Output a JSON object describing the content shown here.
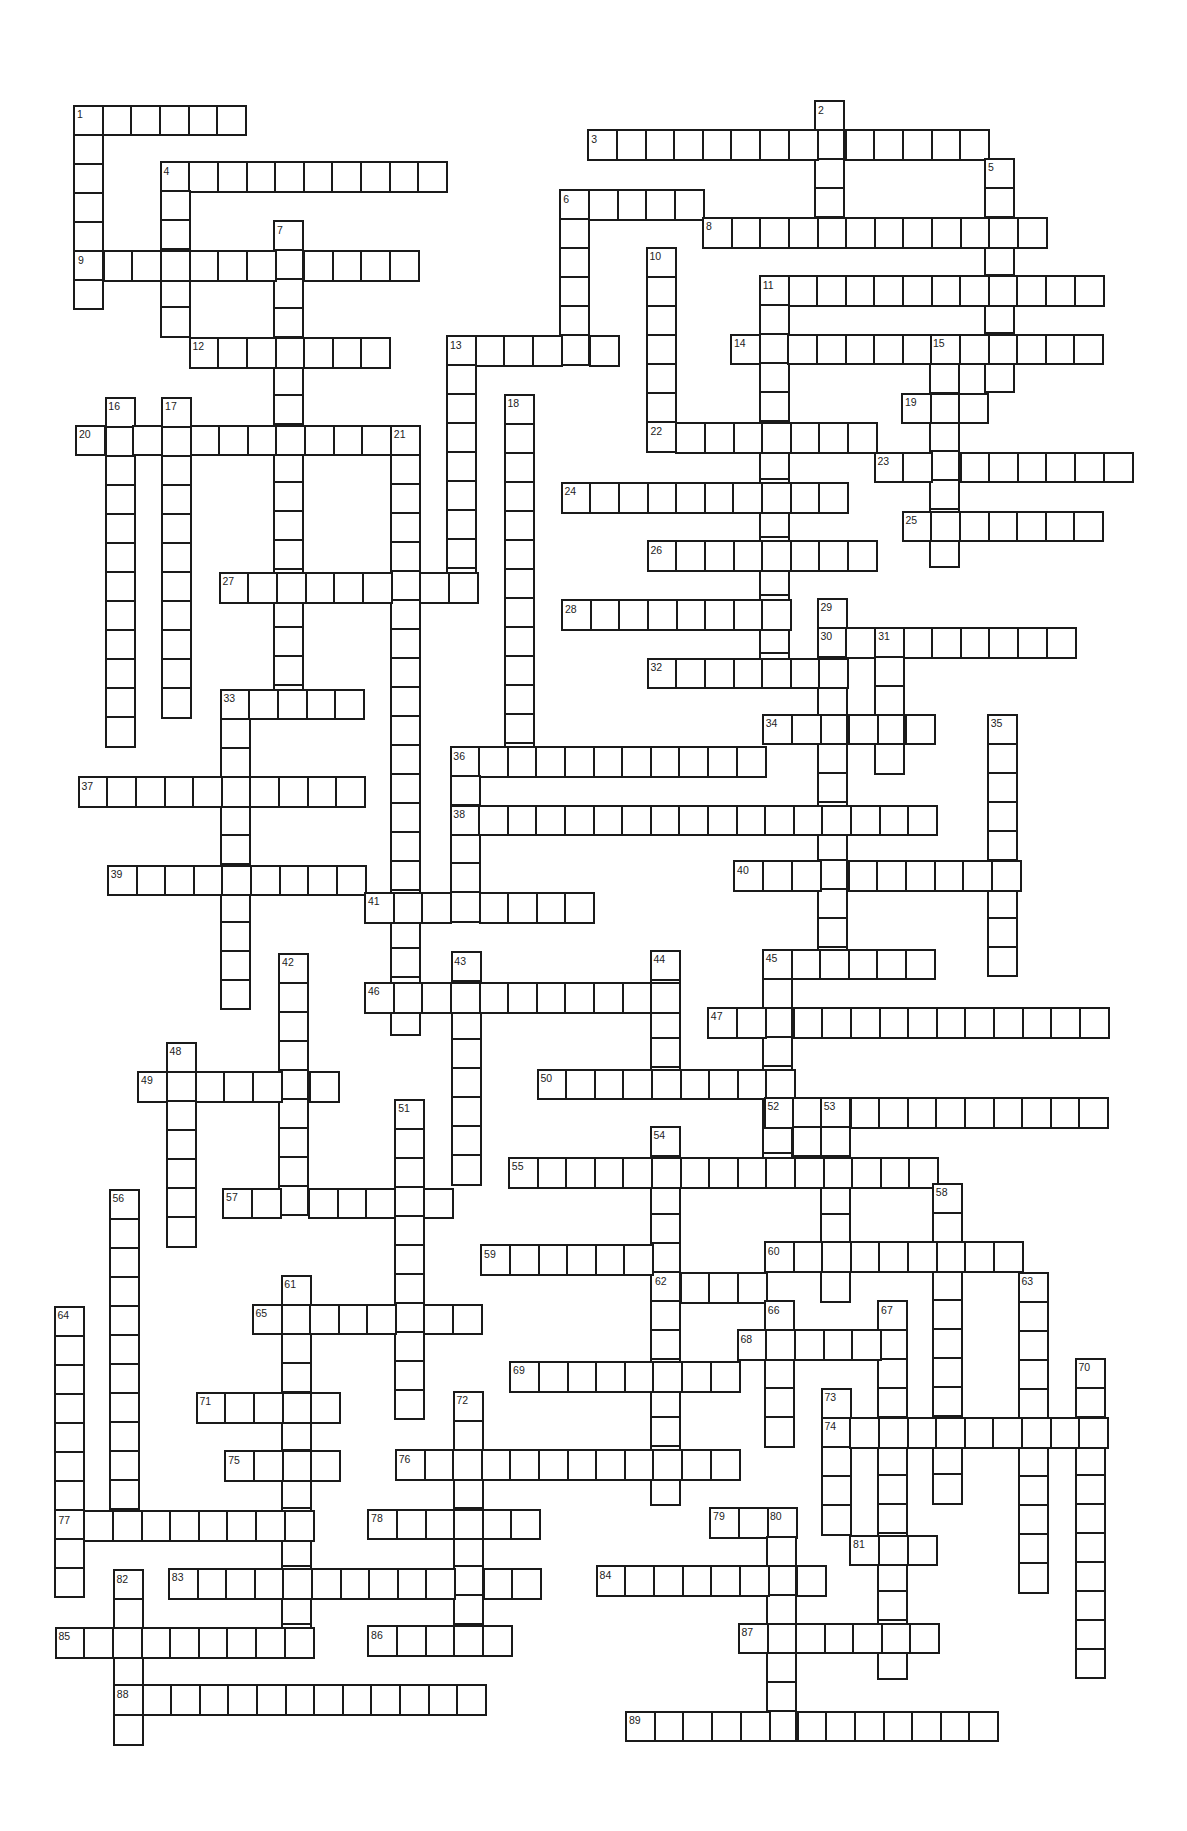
{
  "puzzle": {
    "type": "crossword",
    "cell_size_px": {
      "w": 28.6,
      "h": 29
    },
    "words": [
      {
        "n": 1,
        "dir": "across",
        "x": 74.5,
        "y": 106,
        "len": 6
      },
      {
        "n": 1,
        "dir": "down",
        "x": 74.5,
        "y": 106,
        "len": 7
      },
      {
        "n": 2,
        "dir": "down",
        "x": 815.6,
        "y": 101.7,
        "len": 5
      },
      {
        "n": 3,
        "dir": "across",
        "x": 588.7,
        "y": 130.7,
        "len": 14
      },
      {
        "n": 4,
        "dir": "across",
        "x": 161,
        "y": 162.7,
        "len": 10
      },
      {
        "n": 4,
        "dir": "down",
        "x": 161,
        "y": 162.7,
        "len": 6
      },
      {
        "n": 5,
        "dir": "down",
        "x": 985.6,
        "y": 159.3,
        "len": 8
      },
      {
        "n": 6,
        "dir": "across",
        "x": 560.7,
        "y": 190.7,
        "len": 5
      },
      {
        "n": 6,
        "dir": "down",
        "x": 560.7,
        "y": 190.7,
        "len": 6
      },
      {
        "n": 7,
        "dir": "down",
        "x": 274.5,
        "y": 221.7,
        "len": 17
      },
      {
        "n": 8,
        "dir": "across",
        "x": 703.5,
        "y": 218.3,
        "len": 12
      },
      {
        "n": 9,
        "dir": "across",
        "x": 75.5,
        "y": 251.7,
        "len": 12
      },
      {
        "n": 10,
        "dir": "down",
        "x": 647,
        "y": 248.3,
        "len": 7
      },
      {
        "n": 11,
        "dir": "across",
        "x": 760.2,
        "y": 276.7,
        "len": 12
      },
      {
        "n": 11,
        "dir": "down",
        "x": 760.2,
        "y": 276.7,
        "len": 14
      },
      {
        "n": 12,
        "dir": "across",
        "x": 190,
        "y": 338.3,
        "len": 7
      },
      {
        "n": 13,
        "dir": "across",
        "x": 447.4,
        "y": 336.7,
        "len": 6
      },
      {
        "n": 13,
        "dir": "down",
        "x": 447.4,
        "y": 336.7,
        "len": 9
      },
      {
        "n": 14,
        "dir": "across",
        "x": 731.5,
        "y": 335,
        "len": 13
      },
      {
        "n": 15,
        "dir": "down",
        "x": 930.5,
        "y": 335,
        "len": 8
      },
      {
        "n": 16,
        "dir": "down",
        "x": 105.8,
        "y": 398.3,
        "len": 12
      },
      {
        "n": 17,
        "dir": "down",
        "x": 162.6,
        "y": 398.3,
        "len": 11
      },
      {
        "n": 18,
        "dir": "down",
        "x": 505,
        "y": 395,
        "len": 13
      },
      {
        "n": 19,
        "dir": "across",
        "x": 902.5,
        "y": 394,
        "len": 3
      },
      {
        "n": 20,
        "dir": "across",
        "x": 76.5,
        "y": 426,
        "len": 12
      },
      {
        "n": 21,
        "dir": "down",
        "x": 391.3,
        "y": 426,
        "len": 21
      },
      {
        "n": 22,
        "dir": "across",
        "x": 648,
        "y": 423.3,
        "len": 8
      },
      {
        "n": 23,
        "dir": "across",
        "x": 875,
        "y": 453,
        "len": 9
      },
      {
        "n": 24,
        "dir": "across",
        "x": 562,
        "y": 483.3,
        "len": 10
      },
      {
        "n": 25,
        "dir": "across",
        "x": 903,
        "y": 512,
        "len": 7
      },
      {
        "n": 26,
        "dir": "across",
        "x": 648,
        "y": 541.7,
        "len": 8
      },
      {
        "n": 27,
        "dir": "across",
        "x": 220,
        "y": 573.3,
        "len": 9
      },
      {
        "n": 28,
        "dir": "across",
        "x": 562.5,
        "y": 600.7,
        "len": 8
      },
      {
        "n": 29,
        "dir": "down",
        "x": 818,
        "y": 599,
        "len": 13
      },
      {
        "n": 30,
        "dir": "across",
        "x": 818,
        "y": 628.3,
        "len": 9
      },
      {
        "n": 31,
        "dir": "down",
        "x": 875.7,
        "y": 628.3,
        "len": 5
      },
      {
        "n": 32,
        "dir": "across",
        "x": 648,
        "y": 659,
        "len": 7
      },
      {
        "n": 33,
        "dir": "across",
        "x": 221,
        "y": 690,
        "len": 5
      },
      {
        "n": 33,
        "dir": "down",
        "x": 221,
        "y": 690,
        "len": 11
      },
      {
        "n": 34,
        "dir": "across",
        "x": 763.2,
        "y": 715,
        "len": 6
      },
      {
        "n": 35,
        "dir": "down",
        "x": 988.2,
        "y": 715,
        "len": 9
      },
      {
        "n": 36,
        "dir": "across",
        "x": 450.8,
        "y": 747.7,
        "len": 11
      },
      {
        "n": 36,
        "dir": "down",
        "x": 450.8,
        "y": 747.7,
        "len": 6
      },
      {
        "n": 37,
        "dir": "across",
        "x": 79,
        "y": 777.7,
        "len": 10
      },
      {
        "n": 38,
        "dir": "across",
        "x": 450.8,
        "y": 806,
        "len": 17
      },
      {
        "n": 39,
        "dir": "across",
        "x": 108.2,
        "y": 866,
        "len": 9
      },
      {
        "n": 40,
        "dir": "across",
        "x": 734.6,
        "y": 861.7,
        "len": 10
      },
      {
        "n": 41,
        "dir": "across",
        "x": 365.4,
        "y": 893.3,
        "len": 8
      },
      {
        "n": 42,
        "dir": "down",
        "x": 279.6,
        "y": 954,
        "len": 9
      },
      {
        "n": 43,
        "dir": "down",
        "x": 451.8,
        "y": 952.7,
        "len": 8
      },
      {
        "n": 44,
        "dir": "down",
        "x": 651,
        "y": 951,
        "len": 5
      },
      {
        "n": 45,
        "dir": "across",
        "x": 763.2,
        "y": 950,
        "len": 6
      },
      {
        "n": 45,
        "dir": "down",
        "x": 763.2,
        "y": 950,
        "len": 8
      },
      {
        "n": 46,
        "dir": "across",
        "x": 365.4,
        "y": 983.3,
        "len": 11
      },
      {
        "n": 47,
        "dir": "across",
        "x": 708.3,
        "y": 1008.3,
        "len": 14
      },
      {
        "n": 48,
        "dir": "down",
        "x": 167.1,
        "y": 1043.3,
        "len": 7
      },
      {
        "n": 49,
        "dir": "across",
        "x": 138.6,
        "y": 1072.3,
        "len": 7
      },
      {
        "n": 50,
        "dir": "across",
        "x": 537.9,
        "y": 1070,
        "len": 9
      },
      {
        "n": 51,
        "dir": "down",
        "x": 395.7,
        "y": 1100,
        "len": 11
      },
      {
        "n": 52,
        "dir": "across",
        "x": 765,
        "y": 1098.3,
        "len": 12
      },
      {
        "n": null,
        "dir": "down",
        "x": 793,
        "y": 1098.3,
        "len": 3
      },
      {
        "n": 53,
        "dir": "down",
        "x": 821.2,
        "y": 1098.3,
        "len": 7
      },
      {
        "n": 54,
        "dir": "down",
        "x": 651,
        "y": 1127.3,
        "len": 13
      },
      {
        "n": 55,
        "dir": "across",
        "x": 509.3,
        "y": 1158.3,
        "len": 15
      },
      {
        "n": 56,
        "dir": "down",
        "x": 110,
        "y": 1190,
        "len": 12
      },
      {
        "n": 57,
        "dir": "across",
        "x": 223.6,
        "y": 1189,
        "len": 8
      },
      {
        "n": 58,
        "dir": "down",
        "x": 933.3,
        "y": 1184.3,
        "len": 11
      },
      {
        "n": 59,
        "dir": "across",
        "x": 481.6,
        "y": 1245.7,
        "len": 7
      },
      {
        "n": 60,
        "dir": "across",
        "x": 765.3,
        "y": 1242.7,
        "len": 9
      },
      {
        "n": 61,
        "dir": "down",
        "x": 281.8,
        "y": 1276,
        "len": 13
      },
      {
        "n": 62,
        "dir": "across",
        "x": 652.4,
        "y": 1273.3,
        "len": 4
      },
      {
        "n": 63,
        "dir": "down",
        "x": 1019,
        "y": 1273.3,
        "len": 11
      },
      {
        "n": 64,
        "dir": "down",
        "x": 55,
        "y": 1307,
        "len": 10
      },
      {
        "n": 65,
        "dir": "across",
        "x": 253,
        "y": 1305,
        "len": 8
      },
      {
        "n": 66,
        "dir": "down",
        "x": 765.3,
        "y": 1301.7,
        "len": 5
      },
      {
        "n": 67,
        "dir": "down",
        "x": 878.6,
        "y": 1301.5,
        "len": 13
      },
      {
        "n": 68,
        "dir": "across",
        "x": 738,
        "y": 1330.7,
        "len": 6
      },
      {
        "n": 69,
        "dir": "across",
        "x": 510.6,
        "y": 1362.3,
        "len": 8
      },
      {
        "n": 70,
        "dir": "down",
        "x": 1076,
        "y": 1359,
        "len": 11
      },
      {
        "n": 71,
        "dir": "across",
        "x": 197,
        "y": 1393.3,
        "len": 5
      },
      {
        "n": 72,
        "dir": "down",
        "x": 454,
        "y": 1392.3,
        "len": 9
      },
      {
        "n": 73,
        "dir": "down",
        "x": 822,
        "y": 1389.3,
        "len": 5
      },
      {
        "n": 74,
        "dir": "across",
        "x": 822,
        "y": 1418.3,
        "len": 10
      },
      {
        "n": 75,
        "dir": "across",
        "x": 225.7,
        "y": 1451.7,
        "len": 4
      },
      {
        "n": 76,
        "dir": "across",
        "x": 396.2,
        "y": 1450.7,
        "len": 12
      },
      {
        "n": 77,
        "dir": "across",
        "x": 56,
        "y": 1511.7,
        "len": 9
      },
      {
        "n": 78,
        "dir": "across",
        "x": 368.6,
        "y": 1510,
        "len": 6
      },
      {
        "n": 79,
        "dir": "across",
        "x": 710.6,
        "y": 1508.3,
        "len": 3
      },
      {
        "n": 80,
        "dir": "down",
        "x": 767.4,
        "y": 1508.3,
        "len": 8
      },
      {
        "n": 81,
        "dir": "across",
        "x": 850.6,
        "y": 1536,
        "len": 3
      },
      {
        "n": 82,
        "dir": "down",
        "x": 114,
        "y": 1570.7,
        "len": 6
      },
      {
        "n": 83,
        "dir": "across",
        "x": 169.3,
        "y": 1569.3,
        "len": 13
      },
      {
        "n": 84,
        "dir": "across",
        "x": 597.1,
        "y": 1566.7,
        "len": 8
      },
      {
        "n": 85,
        "dir": "across",
        "x": 56,
        "y": 1628.3,
        "len": 9
      },
      {
        "n": 86,
        "dir": "across",
        "x": 368.6,
        "y": 1626.7,
        "len": 5
      },
      {
        "n": 87,
        "dir": "across",
        "x": 739,
        "y": 1624,
        "len": 7
      },
      {
        "n": 88,
        "dir": "across",
        "x": 114.3,
        "y": 1685.7,
        "len": 13
      },
      {
        "n": 89,
        "dir": "across",
        "x": 626.5,
        "y": 1712,
        "len": 13
      }
    ]
  },
  "colors": {
    "grid_line": "#1a1a1a",
    "cell_fill": "#ffffff",
    "number_text": "#222222",
    "background": "#ffffff"
  }
}
